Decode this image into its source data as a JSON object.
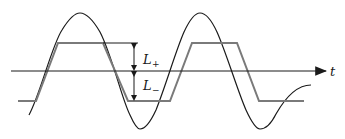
{
  "diagram": {
    "title": "",
    "axis_label": "t",
    "labels": {
      "upper_limit": {
        "main": "L",
        "sub": "+"
      },
      "lower_limit": {
        "main": "L",
        "sub": "−"
      }
    },
    "colors": {
      "sine": "#1a1a1a",
      "clipped": "#7a7a7a",
      "axis": "#1a1a1a",
      "arrows": "#1a1a1a"
    },
    "geometry": {
      "axis_y": 71,
      "axis_x_start": 11,
      "axis_x_end": 326,
      "sine_amplitude": 58,
      "sine_period": 121,
      "upper_clip_y": 43,
      "lower_clip_y": 101,
      "dimension_x": 134
    }
  }
}
